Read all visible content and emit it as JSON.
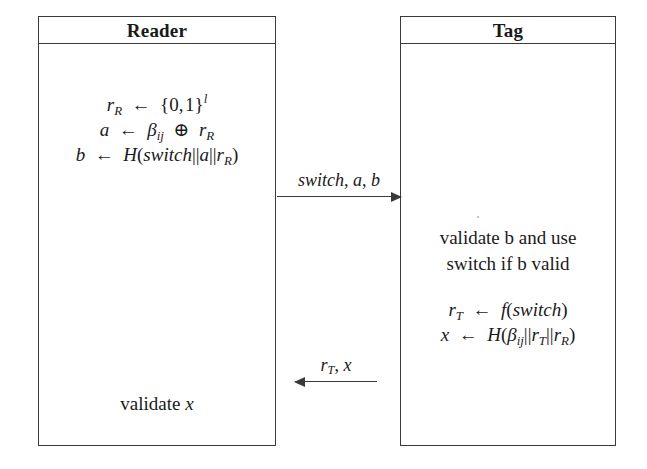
{
  "diagram": {
    "type": "protocol-sequence",
    "background_color": "#ffffff",
    "line_color": "#3a3a3a",
    "text_color": "#1a1a1a",
    "parties": [
      {
        "id": "reader",
        "title": "Reader"
      },
      {
        "id": "tag",
        "title": "Tag"
      }
    ]
  },
  "reader": {
    "title": "Reader",
    "step1": {
      "lines": [
        "rR ← {0,1}^l",
        "a ← βij ⊕ rR",
        "b ← H(switch||a||rR)"
      ]
    },
    "step2": {
      "lines": [
        "validate x"
      ]
    }
  },
  "tag": {
    "title": "Tag",
    "step1": {
      "lines": [
        "validate b and use",
        "switch if b valid"
      ]
    },
    "step2": {
      "lines": [
        "rT ← f(switch)",
        "x ← H(βij||rT||rR)"
      ]
    }
  },
  "messages": [
    {
      "id": "reader-to-tag",
      "label": "switch, a, b",
      "direction": "right",
      "from": "reader",
      "to": "tag"
    },
    {
      "id": "tag-to-reader",
      "label": "rT, x",
      "direction": "left",
      "from": "tag",
      "to": "reader"
    }
  ]
}
